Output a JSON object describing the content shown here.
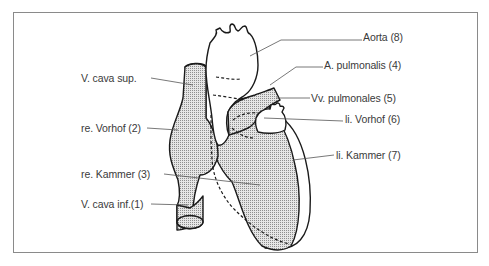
{
  "diagram": {
    "title": "",
    "colors": {
      "outline": "#1a1a1a",
      "shading": "#b8b8b8",
      "label_text": "#3a3a3a",
      "frame": "#8a8a8a"
    },
    "labels_left": [
      {
        "id": "v-cava-sup",
        "text": "V. cava  sup."
      },
      {
        "id": "re-vorhof",
        "text": "re. Vorhof (2)"
      },
      {
        "id": "re-kammer",
        "text": "re. Kammer (3)"
      },
      {
        "id": "v-cava-inf",
        "text": "V. cava inf.(1)"
      }
    ],
    "labels_right": [
      {
        "id": "aorta",
        "text": "Aorta (8)"
      },
      {
        "id": "a-pulmonalis",
        "text": "A. pulmonalis (4)"
      },
      {
        "id": "vv-pulmonales",
        "text": "Vv. pulmonales (5)"
      },
      {
        "id": "li-vorhof",
        "text": "li. Vorhof (6)"
      },
      {
        "id": "li-kammer",
        "text": "li. Kammer (7)"
      }
    ]
  }
}
